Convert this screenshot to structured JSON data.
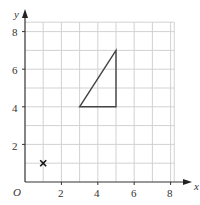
{
  "diagram": {
    "type": "coordinate-grid",
    "axes": {
      "x_label": "x",
      "y_label": "y",
      "origin_label": "O",
      "x_ticks": [
        "2",
        "4",
        "6",
        "8"
      ],
      "y_ticks": [
        "2",
        "4",
        "6",
        "8"
      ]
    },
    "grid": {
      "x_range": [
        0,
        9
      ],
      "y_range": [
        0,
        8.5
      ],
      "step": 1,
      "color": "#cfcfcf"
    },
    "shapes": [
      {
        "type": "triangle",
        "vertices": [
          [
            3,
            4
          ],
          [
            5,
            4
          ],
          [
            5,
            7
          ]
        ],
        "stroke": "#444444"
      }
    ],
    "markers": [
      {
        "type": "cross",
        "point": [
          1,
          1
        ],
        "label": "×"
      }
    ]
  }
}
